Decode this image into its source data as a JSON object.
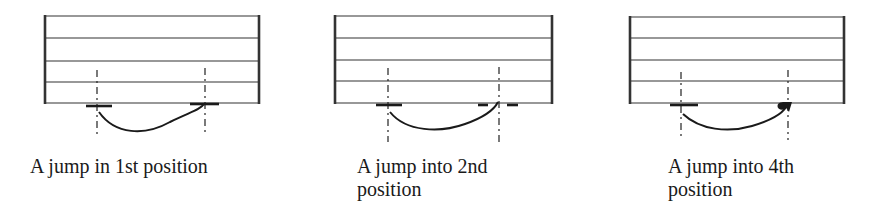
{
  "figure": {
    "panels": [
      {
        "id": "jump-1st",
        "caption_lines": [
          "A jump in 1st position"
        ],
        "start_marker": "bar",
        "end_marker": "bar",
        "end_marker_note": "bar with curve ending on it"
      },
      {
        "id": "jump-2nd",
        "caption_lines": [
          "A jump into 2nd",
          "position"
        ],
        "start_marker": "bar",
        "end_marker": "dashed-bar",
        "end_marker_note": "broken bar split by guide line"
      },
      {
        "id": "jump-4th",
        "caption_lines": [
          "A jump into 4th",
          "position"
        ],
        "start_marker": "bar",
        "end_marker": "dot-arrow",
        "end_marker_note": "filled dot with arrowhead"
      }
    ],
    "colors": {
      "ink": "#1a1a1a",
      "staff_line": "#333333",
      "background": "#ffffff"
    }
  }
}
